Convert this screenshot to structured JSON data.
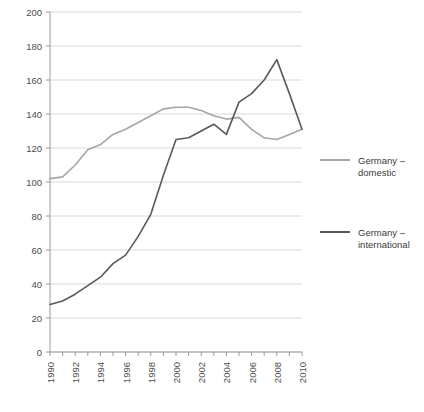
{
  "chart_data": {
    "type": "line",
    "title": "",
    "subtitle": "",
    "xlabel": "",
    "ylabel": "",
    "xlim": [
      1990,
      2010
    ],
    "ylim": [
      0,
      200
    ],
    "grid": true,
    "grid_axis": "y",
    "legend_position": "right",
    "x": [
      1990,
      1991,
      1992,
      1993,
      1994,
      1995,
      1996,
      1997,
      1998,
      1999,
      2000,
      2001,
      2002,
      2003,
      2004,
      2005,
      2006,
      2007,
      2008,
      2009,
      2010
    ],
    "x_tick_labels": [
      "1990",
      "1992",
      "1994",
      "1996",
      "1998",
      "2000",
      "2002",
      "2004",
      "2006",
      "2008",
      "2010"
    ],
    "y_tick_labels": [
      "0",
      "20",
      "40",
      "60",
      "80",
      "100",
      "120",
      "140",
      "160",
      "180",
      "200"
    ],
    "y_ticks": [
      0,
      20,
      40,
      60,
      80,
      100,
      120,
      140,
      160,
      180,
      200
    ],
    "series": [
      {
        "name": "Germany – domestic",
        "color": "#a6a6a6",
        "values": [
          102,
          103,
          110,
          119,
          122,
          128,
          131,
          135,
          139,
          143,
          144,
          144,
          142,
          139,
          137,
          138,
          131,
          126,
          125,
          128,
          131
        ]
      },
      {
        "name": "Germany – international",
        "color": "#595959",
        "values": [
          28,
          30,
          34,
          39,
          44,
          52,
          57,
          68,
          81,
          104,
          125,
          126,
          130,
          134,
          128,
          147,
          152,
          160,
          172,
          152,
          131
        ]
      }
    ]
  },
  "legend": {
    "items": [
      {
        "line1": "Germany –",
        "line2": "domestic",
        "color": "#a6a6a6"
      },
      {
        "line1": "Germany –",
        "line2": "international",
        "color": "#595959"
      }
    ]
  }
}
